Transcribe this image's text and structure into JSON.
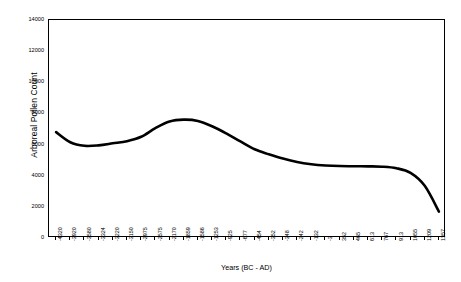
{
  "chart_data": {
    "type": "line",
    "title": "",
    "xlabel": "Years (BC - AD)",
    "ylabel": "Arboreal Pollen Count",
    "ylim": [
      0,
      14000
    ],
    "y_ticks": [
      0,
      2000,
      4000,
      6000,
      8000,
      10000,
      12000,
      14000
    ],
    "y_tick_labels": [
      "0",
      "2000",
      "4000",
      "6000",
      "8000",
      "10000",
      "12000",
      "14000"
    ],
    "grid": false,
    "legend": false,
    "legend_position": "none",
    "line_color": "#000000",
    "line_width": 2.6,
    "categories": [
      "-4320",
      "-3920",
      "-3580",
      "-3324",
      "-3220",
      "-3150",
      "-2975",
      "-2575",
      "-2170",
      "-1859",
      "-1586",
      "-1253",
      "-925",
      "-677",
      "-454",
      "-352",
      "-348",
      "-242",
      "-132",
      "-3",
      "352",
      "465",
      "613",
      "767",
      "913",
      "1055",
      "1209",
      "1357"
    ],
    "values": [
      6800,
      6150,
      5920,
      5950,
      6080,
      6220,
      6500,
      7050,
      7480,
      7600,
      7520,
      7180,
      6720,
      6200,
      5700,
      5380,
      5100,
      4880,
      4740,
      4660,
      4620,
      4610,
      4600,
      4580,
      4480,
      4180,
      3350,
      1700
    ]
  }
}
